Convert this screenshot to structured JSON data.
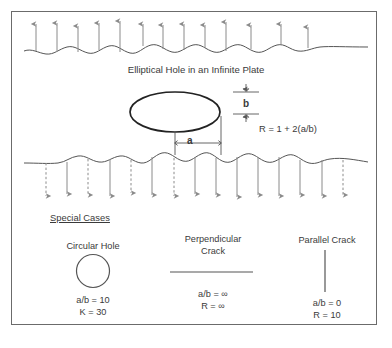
{
  "figure": {
    "title": "Elliptical Hole in an Infinite Plate",
    "formula": "R = 1 + 2(a/b)",
    "dimension_b": "b",
    "dimension_a": "a",
    "colors": {
      "frame": "#6b6b6b",
      "stroke": "#555555",
      "arrow": "#8a8a8a",
      "ellipse": "#222222",
      "text": "#3a3a3a",
      "background": "#ffffff"
    }
  },
  "special_cases": {
    "heading": "Special Cases",
    "items": [
      {
        "name": "circular-hole",
        "title": "Circular Hole",
        "shape": "circle",
        "ratio": "a/b = 10",
        "result": "K = 30"
      },
      {
        "name": "perpendicular-crack",
        "title_line1": "Perpendicular",
        "title_line2": "Crack",
        "shape": "horizontal-line",
        "ratio": "a/b = ∞",
        "result": "R = ∞"
      },
      {
        "name": "parallel-crack",
        "title": "Parallel Crack",
        "shape": "vertical-line",
        "ratio": "a/b = 0",
        "result": "R = 10"
      }
    ]
  },
  "loading": {
    "top_arrows_direction": "up",
    "bottom_arrows_direction": "down",
    "top_arrow_count": 13,
    "bottom_arrow_count": 15
  }
}
